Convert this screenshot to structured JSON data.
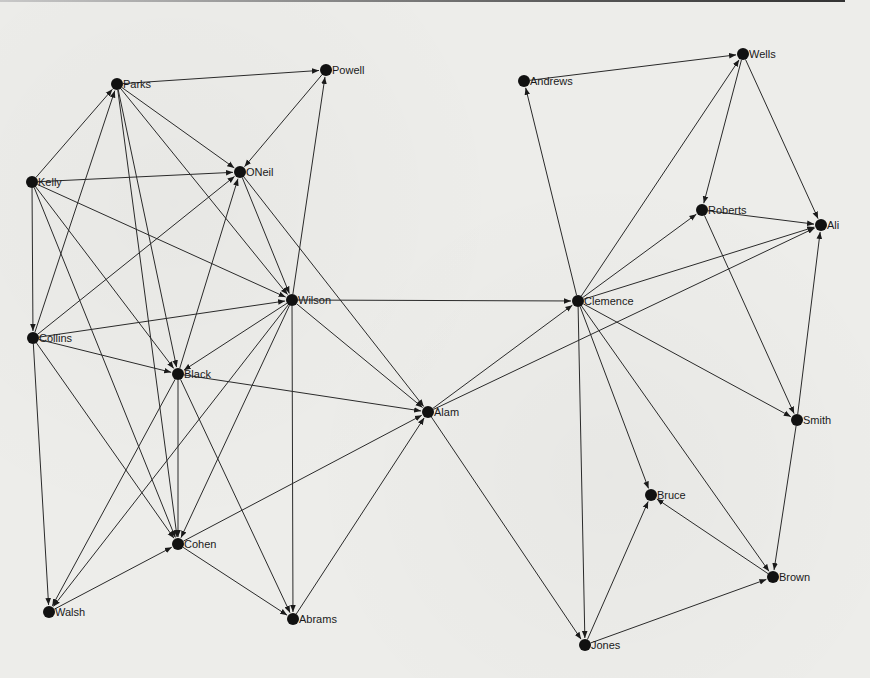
{
  "figure": {
    "title": "",
    "type": "directed network diagram"
  },
  "colors": {
    "background": "#ededea",
    "edge": "#2a2a2a",
    "node": "#111111",
    "label": "#1a1a1a"
  },
  "nodes": [
    {
      "id": "Parks",
      "label": "Parks",
      "x": 117,
      "y": 84
    },
    {
      "id": "Powell",
      "label": "Powell",
      "x": 326,
      "y": 70
    },
    {
      "id": "ONeil",
      "label": "ONeil",
      "x": 240,
      "y": 172
    },
    {
      "id": "Kelly",
      "label": "Kelly",
      "x": 32,
      "y": 182
    },
    {
      "id": "Wilson",
      "label": "Wilson",
      "x": 292,
      "y": 300
    },
    {
      "id": "Collins",
      "label": "Collins",
      "x": 33,
      "y": 338
    },
    {
      "id": "Black",
      "label": "Black",
      "x": 178,
      "y": 374
    },
    {
      "id": "Alam",
      "label": "Alam",
      "x": 428,
      "y": 412
    },
    {
      "id": "Cohen",
      "label": "Cohen",
      "x": 178,
      "y": 544
    },
    {
      "id": "Walsh",
      "label": "Walsh",
      "x": 49,
      "y": 612
    },
    {
      "id": "Abrams",
      "label": "Abrams",
      "x": 293,
      "y": 619
    },
    {
      "id": "Andrews",
      "label": "Andrews",
      "x": 524,
      "y": 81
    },
    {
      "id": "Wells",
      "label": "Wells",
      "x": 743,
      "y": 54
    },
    {
      "id": "Roberts",
      "label": "Roberts",
      "x": 702,
      "y": 210
    },
    {
      "id": "Ali",
      "label": "Ali",
      "x": 821,
      "y": 225
    },
    {
      "id": "Clemence",
      "label": "Clemence",
      "x": 578,
      "y": 301
    },
    {
      "id": "Smith",
      "label": "Smith",
      "x": 797,
      "y": 420
    },
    {
      "id": "Bruce",
      "label": "Bruce",
      "x": 651,
      "y": 495
    },
    {
      "id": "Brown",
      "label": "Brown",
      "x": 773,
      "y": 577
    },
    {
      "id": "Jones",
      "label": "Jones",
      "x": 585,
      "y": 645
    }
  ],
  "edges": [
    [
      "Parks",
      "Powell"
    ],
    [
      "Parks",
      "ONeil"
    ],
    [
      "Kelly",
      "Parks"
    ],
    [
      "Collins",
      "Parks"
    ],
    [
      "Parks",
      "Black"
    ],
    [
      "Parks",
      "Cohen"
    ],
    [
      "Parks",
      "Wilson"
    ],
    [
      "Kelly",
      "ONeil"
    ],
    [
      "Wilson",
      "Powell"
    ],
    [
      "Powell",
      "ONeil"
    ],
    [
      "Collins",
      "ONeil"
    ],
    [
      "Black",
      "ONeil"
    ],
    [
      "ONeil",
      "Wilson"
    ],
    [
      "ONeil",
      "Alam"
    ],
    [
      "Kelly",
      "Wilson"
    ],
    [
      "Kelly",
      "Collins"
    ],
    [
      "Kelly",
      "Black"
    ],
    [
      "Kelly",
      "Cohen"
    ],
    [
      "Collins",
      "Wilson"
    ],
    [
      "Collins",
      "Black"
    ],
    [
      "Collins",
      "Walsh"
    ],
    [
      "Collins",
      "Cohen"
    ],
    [
      "Wilson",
      "Black"
    ],
    [
      "Wilson",
      "Clemence"
    ],
    [
      "Wilson",
      "Alam"
    ],
    [
      "Wilson",
      "Abrams"
    ],
    [
      "Wilson",
      "Cohen"
    ],
    [
      "Wilson",
      "Walsh"
    ],
    [
      "Black",
      "Alam"
    ],
    [
      "Black",
      "Cohen"
    ],
    [
      "Black",
      "Walsh"
    ],
    [
      "Black",
      "Abrams"
    ],
    [
      "Cohen",
      "Alam"
    ],
    [
      "Walsh",
      "Cohen"
    ],
    [
      "Cohen",
      "Abrams"
    ],
    [
      "Abrams",
      "Alam"
    ],
    [
      "Alam",
      "Clemence"
    ],
    [
      "Alam",
      "Ali"
    ],
    [
      "Alam",
      "Jones"
    ],
    [
      "Clemence",
      "Andrews"
    ],
    [
      "Andrews",
      "Wells"
    ],
    [
      "Clemence",
      "Wells"
    ],
    [
      "Clemence",
      "Roberts"
    ],
    [
      "Clemence",
      "Ali"
    ],
    [
      "Clemence",
      "Smith"
    ],
    [
      "Clemence",
      "Bruce"
    ],
    [
      "Clemence",
      "Brown"
    ],
    [
      "Clemence",
      "Jones"
    ],
    [
      "Wells",
      "Roberts"
    ],
    [
      "Wells",
      "Ali"
    ],
    [
      "Roberts",
      "Ali"
    ],
    [
      "Roberts",
      "Smith"
    ],
    [
      "Smith",
      "Ali"
    ],
    [
      "Smith",
      "Brown"
    ],
    [
      "Brown",
      "Bruce"
    ],
    [
      "Jones",
      "Bruce"
    ],
    [
      "Jones",
      "Brown"
    ]
  ]
}
